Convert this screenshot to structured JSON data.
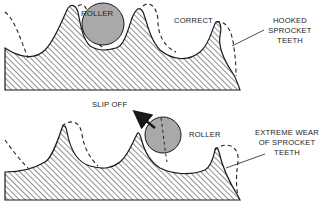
{
  "colors": {
    "roller_fill": "#a9a9a9",
    "outline": "#1a1a1a",
    "hatch": "#333333"
  },
  "top_panel": {
    "roller_label": "ROLLER",
    "correct_label": "CORRECT",
    "hooked_label_lines": [
      "HOOKED",
      "SPROCKET",
      "TEETH"
    ]
  },
  "bottom_panel": {
    "slip_off_label": "SLIP OFF",
    "roller_label": "ROLLER",
    "wear_label_lines": [
      "EXTREME WEAR",
      "OF SPROCKET",
      "TEETH"
    ]
  }
}
